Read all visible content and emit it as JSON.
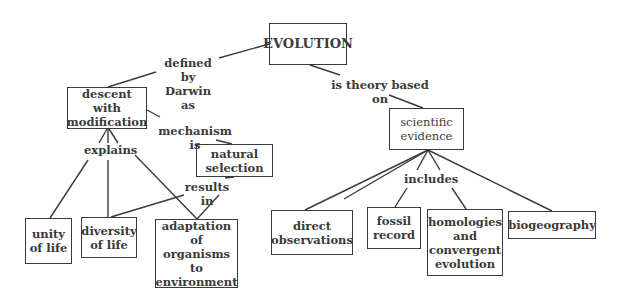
{
  "diagram": {
    "type": "concept-map",
    "nodes": {
      "evolution": "EVOLUTION",
      "descent": "descent with\nmodification",
      "natural_selection": "natural\nselection",
      "scientific_evidence": "scientific\nevidence",
      "unity": "unity\nof life",
      "diversity": "diversity\nof life",
      "adaptation": "adaptation of\norganisms to\nenvironment",
      "direct_obs": "direct\nobservations",
      "fossil": "fossil\nrecord",
      "homologies": "homologies\nand\nconvergent\nevolution",
      "biogeography": "biogeography"
    },
    "links": {
      "defined_by": "defined by\nDarwin as",
      "theory_based": "is theory based\non",
      "mechanism": "mechanism is",
      "explains": "explains",
      "results_in": "results in",
      "includes": "includes"
    },
    "colors": {
      "line": "#3a3a3a",
      "background": "#ffffff"
    }
  }
}
